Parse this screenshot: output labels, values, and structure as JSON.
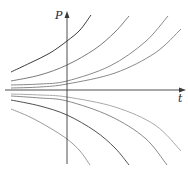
{
  "diagram": {
    "type": "family-of-solution-curves",
    "axes": {
      "x_label": "t",
      "y_label": "P",
      "color": "#3a3a3a"
    },
    "curves": [
      {
        "id": "upper-1",
        "color": "#3c3c3c",
        "points": [
          [
            11,
            72
          ],
          [
            30,
            63
          ],
          [
            50,
            53
          ],
          [
            67,
            41
          ],
          [
            80,
            30
          ],
          [
            91,
            15
          ]
        ]
      },
      {
        "id": "upper-2",
        "color": "#7a7a7a",
        "points": [
          [
            11,
            81
          ],
          [
            40,
            75
          ],
          [
            67,
            65
          ],
          [
            95,
            49
          ],
          [
            115,
            32
          ],
          [
            129,
            16
          ]
        ]
      },
      {
        "id": "upper-3",
        "color": "#8a8a8a",
        "points": [
          [
            11,
            85
          ],
          [
            40,
            84
          ],
          [
            67,
            81
          ],
          [
            110,
            66
          ],
          [
            145,
            42
          ],
          [
            168,
            16
          ]
        ]
      },
      {
        "id": "upper-4",
        "color": "#8a8a8a",
        "points": [
          [
            11,
            88
          ],
          [
            40,
            87
          ],
          [
            67,
            84
          ],
          [
            115,
            73
          ],
          [
            155,
            53
          ],
          [
            181,
            29
          ]
        ]
      },
      {
        "id": "lower-1",
        "color": "#aaaaaa",
        "points": [
          [
            11,
            94
          ],
          [
            40,
            95
          ],
          [
            67,
            97
          ],
          [
            115,
            107
          ],
          [
            155,
            125
          ],
          [
            181,
            151
          ]
        ]
      },
      {
        "id": "lower-2",
        "color": "#8a8a8a",
        "points": [
          [
            11,
            96
          ],
          [
            40,
            98
          ],
          [
            67,
            101
          ],
          [
            110,
            116
          ],
          [
            145,
            138
          ],
          [
            167,
            165
          ]
        ]
      },
      {
        "id": "lower-3",
        "color": "#505050",
        "points": [
          [
            11,
            100
          ],
          [
            40,
            106
          ],
          [
            67,
            115
          ],
          [
            95,
            131
          ],
          [
            115,
            148
          ],
          [
            129,
            165
          ]
        ]
      },
      {
        "id": "lower-4",
        "color": "#9a9a9a",
        "points": [
          [
            11,
            109
          ],
          [
            30,
            117
          ],
          [
            50,
            128
          ],
          [
            67,
            139
          ],
          [
            80,
            151
          ],
          [
            90,
            165
          ]
        ]
      }
    ]
  }
}
